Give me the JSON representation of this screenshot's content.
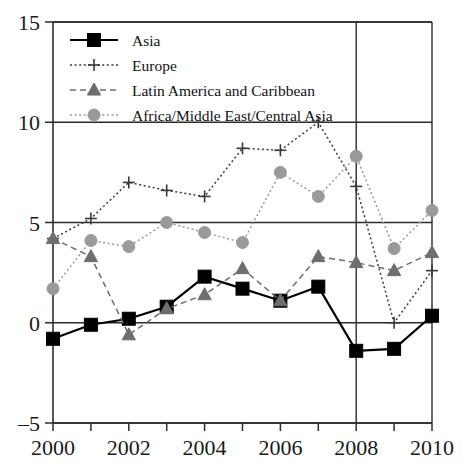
{
  "chart_data": {
    "type": "line",
    "title": "",
    "subtitle": "",
    "xlabel": "",
    "ylabel": "",
    "x": [
      2000,
      2001,
      2002,
      2003,
      2004,
      2005,
      2006,
      2007,
      2008,
      2009,
      2010
    ],
    "xlim": [
      2000,
      2010
    ],
    "ylim": [
      -5,
      15
    ],
    "y_ticks": [
      -5,
      0,
      5,
      10,
      15
    ],
    "y_tick_labels": [
      "–5",
      "0",
      "5",
      "10",
      "15"
    ],
    "x_ticks": [
      2000,
      2001,
      2002,
      2003,
      2004,
      2005,
      2006,
      2007,
      2008,
      2009,
      2010
    ],
    "x_tick_labels_shown": [
      "2000",
      "2002",
      "2004",
      "2006",
      "2008",
      "2010"
    ],
    "x_labeled_values": [
      2000,
      2002,
      2004,
      2006,
      2008,
      2010
    ],
    "grid": "horizontal-at-y-ticks-plus-vertical-at-2008",
    "legend_position": "top-left-inside",
    "series": [
      {
        "name": "Asia",
        "marker": "square-filled",
        "line_style": "solid",
        "color": "#000000",
        "values": [
          -0.8,
          -0.1,
          0.2,
          0.8,
          2.3,
          1.7,
          1.1,
          1.8,
          -1.4,
          -1.3,
          0.35
        ]
      },
      {
        "name": "Europe",
        "marker": "plus",
        "line_style": "dotted",
        "color": "#3a3a3a",
        "values": [
          4.2,
          5.2,
          7.0,
          6.6,
          6.3,
          8.7,
          8.6,
          10.0,
          6.8,
          0.0,
          2.6
        ]
      },
      {
        "name": "Latin America and Caribbean",
        "marker": "triangle",
        "line_style": "dashed",
        "color": "#6e6e6e",
        "values": [
          4.2,
          3.3,
          -0.6,
          0.7,
          1.4,
          2.7,
          1.1,
          3.3,
          3.0,
          2.6,
          3.5
        ]
      },
      {
        "name": "Africa/Middle East/Central Asia",
        "marker": "circle",
        "line_style": "dotted",
        "color": "#9a9a9a",
        "values": [
          1.7,
          4.1,
          3.8,
          5.0,
          4.5,
          4.0,
          7.5,
          6.3,
          8.3,
          3.7,
          5.6
        ]
      }
    ]
  },
  "legend": {
    "items": [
      {
        "label": "Asia",
        "marker": "square-filled"
      },
      {
        "label": "Europe",
        "marker": "plus"
      },
      {
        "label": "Latin America and Caribbean",
        "marker": "triangle"
      },
      {
        "label": "Africa/Middle East/Central Asia",
        "marker": "circle"
      }
    ]
  },
  "axes": {
    "y_labels": [
      "15",
      "10",
      "5",
      "0",
      "–5"
    ],
    "x_labels": [
      "2000",
      "2002",
      "2004",
      "2006",
      "2008",
      "2010"
    ]
  }
}
